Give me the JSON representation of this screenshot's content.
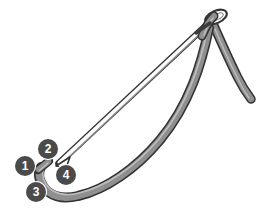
{
  "diagram": {
    "type": "line-illustration",
    "canvas": {
      "width": 264,
      "height": 222,
      "background": "#ffffff"
    },
    "palette": {
      "outline": "#333333",
      "thread_fill": "#8a8a8a",
      "needle_fill": "#ffffff",
      "needle_shadow": "#6e6e6e",
      "badge_fill": "#4a4a4a",
      "badge_text": "#ffffff"
    },
    "parts": [
      {
        "name": "needle-shaft",
        "description": "thin straight white shaft with dark outline running from lower-left tip to upper-right eye"
      },
      {
        "name": "needle-tip",
        "description": "sharp point at lower left"
      },
      {
        "name": "needle-eye",
        "description": "oval eye at the top right of the needle"
      },
      {
        "name": "thread-loop",
        "description": "thick gray band looping from the eye down left, sweeping along the bottom and back up"
      },
      {
        "name": "thread-tail",
        "description": "short gray stub near the left end of the loop"
      },
      {
        "name": "thread-free-end",
        "description": "thread descending to the lower right and ending"
      }
    ]
  },
  "badges": [
    {
      "id": 1,
      "label": "1",
      "x": 15,
      "y": 156
    },
    {
      "id": 2,
      "label": "2",
      "x": 38,
      "y": 139
    },
    {
      "id": 3,
      "label": "3",
      "x": 26,
      "y": 182
    },
    {
      "id": 4,
      "label": "4",
      "x": 56,
      "y": 165
    }
  ]
}
